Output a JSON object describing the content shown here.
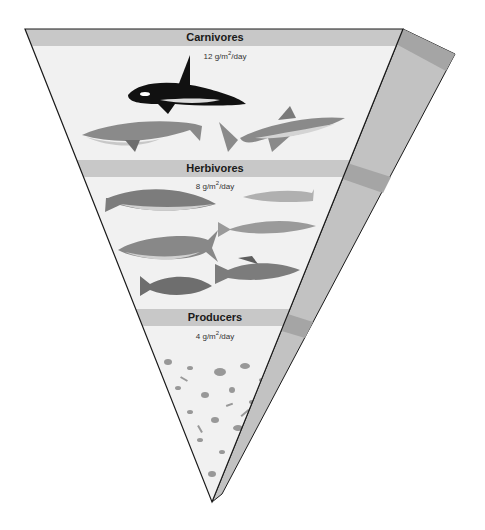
{
  "diagram": {
    "type": "inverted-biomass-pyramid",
    "levels": [
      {
        "name": "Carnivores",
        "value": "12",
        "unit_pre": "g/m",
        "unit_sup": "2",
        "unit_post": "/day",
        "organisms": [
          "orca",
          "humpback-whale",
          "great-white-shark"
        ]
      },
      {
        "name": "Herbivores",
        "value": "8",
        "unit_pre": "g/m",
        "unit_sup": "2",
        "unit_post": "/day",
        "organisms": [
          "cod",
          "herring",
          "minnow",
          "tuna",
          "grouper",
          "trout"
        ]
      },
      {
        "name": "Producers",
        "value": "4",
        "unit_pre": "g/m",
        "unit_sup": "2",
        "unit_post": "/day",
        "organisms": [
          "phytoplankton"
        ]
      }
    ],
    "colors": {
      "face": "#f1f1f1",
      "band": "#c8c8c8",
      "side": "#c2c2c2",
      "side_band": "#a5a5a5",
      "outline": "#1a1a1a"
    }
  }
}
